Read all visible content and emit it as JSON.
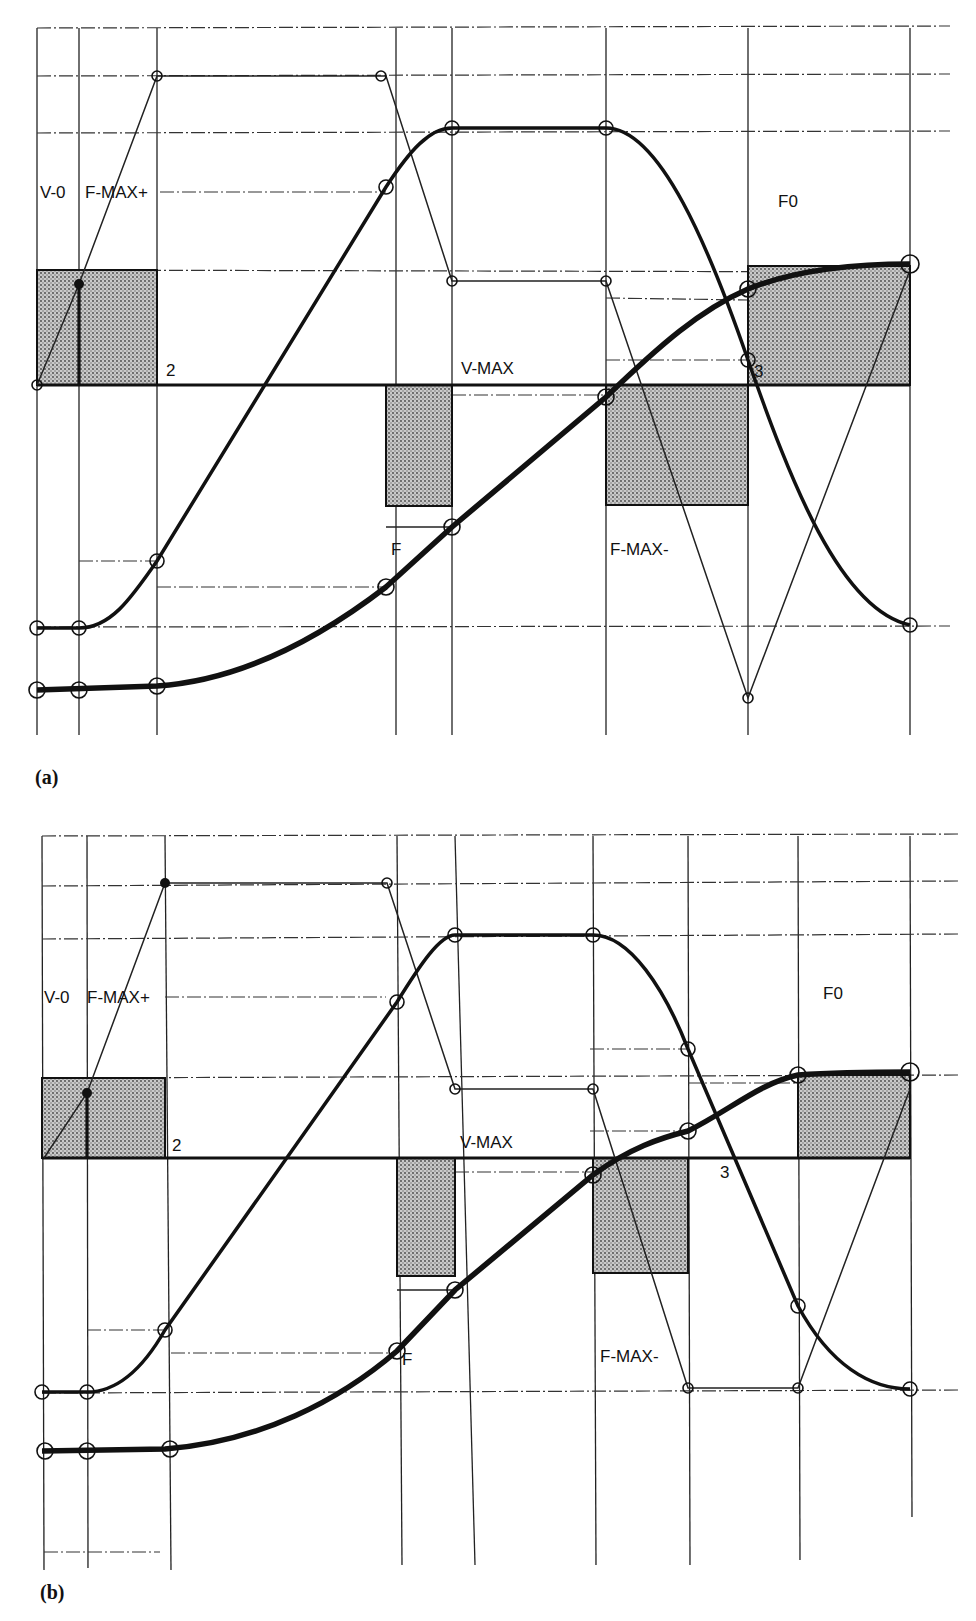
{
  "panels": [
    {
      "id": "a",
      "caption": "(a)",
      "labels": {
        "v0": "V-0",
        "fmax_plus": "F-MAX+",
        "seg2": "2",
        "vmax": "V-MAX",
        "f": "F",
        "fmax_minus": "F-MAX-",
        "f0": "F0",
        "seg3": "3"
      }
    },
    {
      "id": "b",
      "caption": "(b)",
      "labels": {
        "v0": "V-0",
        "fmax_plus": "F-MAX+",
        "seg2": "2",
        "vmax": "V-MAX",
        "f": "F",
        "fmax_minus": "F-MAX-",
        "f0": "F0",
        "seg3": "3"
      }
    }
  ],
  "legend_semantics": {
    "thin_polyline": "force / acceleration profile",
    "medium_curve": "velocity profile",
    "thick_curve": "position profile",
    "shaded_boxes": "impulse areas"
  },
  "colors": {
    "ink": "#111111",
    "paper": "#ffffff",
    "shade": "#9a9a9a"
  }
}
